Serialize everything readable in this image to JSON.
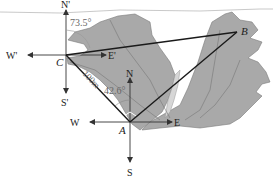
{
  "diagram": {
    "type": "vector-geometry",
    "colors": {
      "terrain": "#a9a9a9",
      "terrain_edge": "#7a7a7a",
      "river": "#d6d6d6",
      "line": "#1a1a1a",
      "arrow": "#333333",
      "angle_text": "#666666"
    },
    "points": {
      "A": "A",
      "B": "B",
      "C": "C"
    },
    "compass_C": {
      "north": "N'",
      "south": "S'",
      "west": "W'",
      "east": "E'"
    },
    "compass_A": {
      "north": "N",
      "south": "S",
      "west": "W",
      "east": "E"
    },
    "angles": {
      "at_C": "73.5°",
      "at_A": "42.6°"
    },
    "distances": {
      "CA": "100m"
    }
  }
}
